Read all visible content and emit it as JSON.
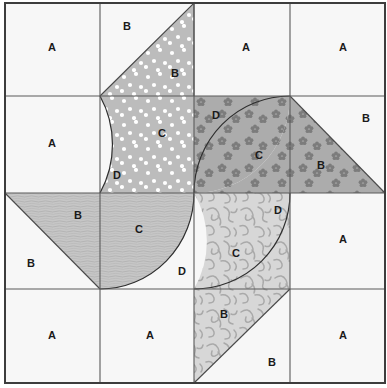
{
  "block": {
    "title": "Quilt Block Piecing Diagram",
    "grid_columns": 4,
    "grid_rows": 4,
    "border_color": "#3d3d3d",
    "grid_line_color": "#5a5a5a",
    "background_fabric_color": "#f7f7f7",
    "label_color": "#1a1a1a"
  },
  "fabrics": [
    {
      "id": "background",
      "name": "background-plain",
      "color": "#f7f7f7",
      "motif": "none"
    },
    {
      "id": "dotted",
      "name": "gray-with-white-dots",
      "color": "#bcbcbc",
      "motif": "white-dots"
    },
    {
      "id": "floral",
      "name": "gray-with-dark-flowers",
      "color": "#acacac",
      "motif": "dark-flowers"
    },
    {
      "id": "mottled",
      "name": "light-gray-fine-lines",
      "color": "#c6c6c6",
      "motif": "fine-lines"
    },
    {
      "id": "vine",
      "name": "pale-gray-vines",
      "color": "#d7d7d7",
      "motif": "vine-scroll"
    }
  ],
  "patch_codes": {
    "A": "A",
    "B": "B",
    "C": "C",
    "D": "D"
  },
  "labels": [
    {
      "code": "A",
      "x": 52,
      "y": 48,
      "name": "patch-label-a-r1c1"
    },
    {
      "code": "B",
      "x": 127,
      "y": 27,
      "name": "patch-label-b-r1c2-bg"
    },
    {
      "code": "B",
      "x": 175,
      "y": 74,
      "name": "patch-label-b-r1c2-dotted"
    },
    {
      "code": "A",
      "x": 246,
      "y": 48,
      "name": "patch-label-a-r1c3"
    },
    {
      "code": "A",
      "x": 343,
      "y": 48,
      "name": "patch-label-a-r1c4"
    },
    {
      "code": "A",
      "x": 52,
      "y": 144,
      "name": "patch-label-a-r2c1"
    },
    {
      "code": "C",
      "x": 162,
      "y": 134,
      "name": "patch-label-c-r2c2-dotted"
    },
    {
      "code": "D",
      "x": 117,
      "y": 176,
      "name": "patch-label-d-r2c2"
    },
    {
      "code": "D",
      "x": 216,
      "y": 116,
      "name": "patch-label-d-r2c3"
    },
    {
      "code": "C",
      "x": 259,
      "y": 156,
      "name": "patch-label-c-r2c3-floral"
    },
    {
      "code": "B",
      "x": 321,
      "y": 166,
      "name": "patch-label-b-r2c4-floral"
    },
    {
      "code": "B",
      "x": 366,
      "y": 119,
      "name": "patch-label-b-r2c4-bg"
    },
    {
      "code": "B",
      "x": 78,
      "y": 216,
      "name": "patch-label-b-r3c1-mottled"
    },
    {
      "code": "B",
      "x": 31,
      "y": 264,
      "name": "patch-label-b-r3c1-bg"
    },
    {
      "code": "C",
      "x": 139,
      "y": 230,
      "name": "patch-label-c-r3c2-mottled"
    },
    {
      "code": "D",
      "x": 182,
      "y": 272,
      "name": "patch-label-d-r3c2"
    },
    {
      "code": "C",
      "x": 236,
      "y": 254,
      "name": "patch-label-c-r3c3-vine"
    },
    {
      "code": "D",
      "x": 278,
      "y": 211,
      "name": "patch-label-d-r3c3"
    },
    {
      "code": "A",
      "x": 343,
      "y": 240,
      "name": "patch-label-a-r3c4"
    },
    {
      "code": "A",
      "x": 52,
      "y": 336,
      "name": "patch-label-a-r4c1"
    },
    {
      "code": "A",
      "x": 150,
      "y": 336,
      "name": "patch-label-a-r4c2"
    },
    {
      "code": "B",
      "x": 224,
      "y": 315,
      "name": "patch-label-b-r4c3-vine"
    },
    {
      "code": "B",
      "x": 272,
      "y": 363,
      "name": "patch-label-b-r4c3-bg"
    },
    {
      "code": "A",
      "x": 343,
      "y": 336,
      "name": "patch-label-a-r4c4"
    }
  ],
  "geometry": {
    "left": 5,
    "top": 3,
    "right": 385,
    "bottom": 383,
    "col_x": [
      5,
      100,
      194,
      290,
      385
    ],
    "row_y": [
      3,
      96,
      193,
      289,
      383
    ]
  }
}
